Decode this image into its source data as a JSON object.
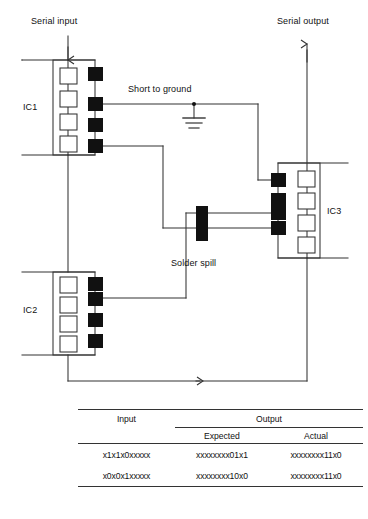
{
  "figure": {
    "type": "circuit-fault-diagram",
    "labels": {
      "serial_input": "Serial input",
      "serial_output": "Serial output",
      "short_to_ground": "Short to ground",
      "solder_spill": "Solder spill",
      "ic1": "IC1",
      "ic2": "IC2",
      "ic3": "IC3"
    },
    "components": [
      {
        "name": "IC1",
        "stages": 4,
        "pads": 4,
        "pad_side": "right"
      },
      {
        "name": "IC2",
        "stages": 4,
        "pads": 4,
        "pad_side": "right"
      },
      {
        "name": "IC3",
        "stages": 4,
        "pads": 4,
        "pad_side": "left"
      }
    ],
    "faults": [
      {
        "name": "short-to-ground",
        "location": "IC1 pad 2"
      },
      {
        "name": "solder-spill",
        "location": "between IC3 pad 2 and IC3 pad 3 traces"
      }
    ],
    "colors": {
      "wire": "#333333",
      "pad_fill": "#111111",
      "stage_fill": "#ffffff",
      "body_stroke": "#333333",
      "background": "#ffffff"
    }
  },
  "table": {
    "headers": {
      "input": "Input",
      "output": "Output",
      "expected": "Expected",
      "actual": "Actual"
    },
    "rows": [
      {
        "input": "x1x1x0xxxxx",
        "expected": "xxxxxxxx01x1",
        "actual": "xxxxxxxx11x0"
      },
      {
        "input": "x0x0x1xxxxx",
        "expected": "xxxxxxxx10x0",
        "actual": "xxxxxxxx11x0"
      }
    ]
  },
  "footer": {
    "caption": "",
    "credit": ""
  }
}
